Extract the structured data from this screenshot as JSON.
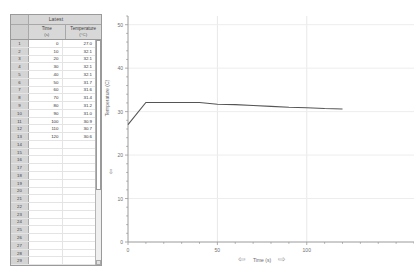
{
  "table": {
    "title": "Latest",
    "columns": [
      {
        "name": "Time",
        "unit": "(s)"
      },
      {
        "name": "Temperature",
        "unit": "(°C)"
      }
    ],
    "rows": [
      {
        "n": "1",
        "time": "0",
        "temp": "27.0"
      },
      {
        "n": "2",
        "time": "10",
        "temp": "32.1"
      },
      {
        "n": "3",
        "time": "20",
        "temp": "32.1"
      },
      {
        "n": "4",
        "time": "30",
        "temp": "32.1"
      },
      {
        "n": "5",
        "time": "40",
        "temp": "32.1"
      },
      {
        "n": "6",
        "time": "50",
        "temp": "31.7"
      },
      {
        "n": "7",
        "time": "60",
        "temp": "31.6"
      },
      {
        "n": "8",
        "time": "70",
        "temp": "31.4"
      },
      {
        "n": "9",
        "time": "80",
        "temp": "31.2"
      },
      {
        "n": "10",
        "time": "90",
        "temp": "31.0"
      },
      {
        "n": "11",
        "time": "100",
        "temp": "30.9"
      },
      {
        "n": "12",
        "time": "110",
        "temp": "30.7"
      },
      {
        "n": "13",
        "time": "120",
        "temp": "30.6"
      },
      {
        "n": "14",
        "time": "",
        "temp": ""
      },
      {
        "n": "15",
        "time": "",
        "temp": ""
      },
      {
        "n": "16",
        "time": "",
        "temp": ""
      },
      {
        "n": "17",
        "time": "",
        "temp": ""
      },
      {
        "n": "18",
        "time": "",
        "temp": ""
      },
      {
        "n": "19",
        "time": "",
        "temp": ""
      },
      {
        "n": "20",
        "time": "",
        "temp": ""
      },
      {
        "n": "21",
        "time": "",
        "temp": ""
      },
      {
        "n": "22",
        "time": "",
        "temp": ""
      },
      {
        "n": "23",
        "time": "",
        "temp": ""
      },
      {
        "n": "24",
        "time": "",
        "temp": ""
      },
      {
        "n": "25",
        "time": "",
        "temp": ""
      },
      {
        "n": "26",
        "time": "",
        "temp": ""
      },
      {
        "n": "27",
        "time": "",
        "temp": ""
      },
      {
        "n": "28",
        "time": "",
        "temp": ""
      },
      {
        "n": "29",
        "time": "",
        "temp": ""
      }
    ]
  },
  "chart_axis": {
    "ylabel": "Temperature (C)",
    "xlabel": "Time (s)",
    "left_arrow": "⇦",
    "right_arrow": "⇨",
    "down_arrow": "⇩"
  },
  "chart_data": {
    "type": "line",
    "title": "",
    "xlabel": "Time (s)",
    "ylabel": "Temperature (C)",
    "xlim": [
      0,
      160
    ],
    "ylim": [
      0,
      52
    ],
    "xticks": [
      0,
      50,
      100
    ],
    "yticks": [
      0,
      10,
      20,
      30,
      40,
      50
    ],
    "xminor_step": 10,
    "yminor_step": 2,
    "grid": true,
    "legend": "none",
    "series": [
      {
        "name": "Temperature",
        "color": "#555555",
        "x": [
          0,
          10,
          20,
          30,
          40,
          50,
          60,
          70,
          80,
          90,
          100,
          110,
          120
        ],
        "y": [
          27.0,
          32.1,
          32.1,
          32.1,
          32.1,
          31.7,
          31.6,
          31.4,
          31.2,
          31.0,
          30.9,
          30.7,
          30.6
        ]
      }
    ]
  }
}
